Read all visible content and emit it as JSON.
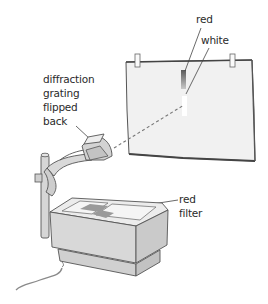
{
  "figure": {
    "labels": {
      "spectrum_red": "red",
      "spectrum_white": "white",
      "grating": [
        "diffraction",
        "grating",
        "flipped",
        "back"
      ],
      "filter": [
        "red",
        "filter"
      ]
    },
    "colors": {
      "line": "#4a4a4a",
      "screen_fill": "#f1f1f1",
      "projector_fill": "#dcdcdc",
      "projector_shadow": "#c4c4c4",
      "filter_patch": "#9a9a9a",
      "red_band_top": "#5a5a5a",
      "red_band_bottom": "#b8b8b8",
      "beam": "#777777"
    }
  }
}
